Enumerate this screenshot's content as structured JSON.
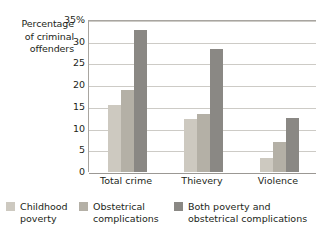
{
  "chart_data": {
    "type": "bar",
    "title": "",
    "xlabel": "",
    "ylabel": "Percentage of criminal offenders",
    "ylim": [
      0,
      35
    ],
    "ytick_labels": [
      "35%",
      "30",
      "25",
      "20",
      "15",
      "10",
      "5",
      "0"
    ],
    "ytick_values": [
      35,
      30,
      25,
      20,
      15,
      10,
      5,
      0
    ],
    "grid": true,
    "legend_position": "bottom",
    "categories": [
      "Total crime",
      "Thievery",
      "Violence"
    ],
    "series": [
      {
        "name": "Childhood poverty",
        "color": "#cdc9c0",
        "values": [
          15.5,
          12.3,
          3.2
        ]
      },
      {
        "name": "Obstetrical complications",
        "color": "#b4b0a6",
        "values": [
          18.8,
          13.3,
          7.0
        ]
      },
      {
        "name": "Both poverty and obstetrical complications",
        "color": "#8a8884",
        "values": [
          32.7,
          28.3,
          12.4
        ]
      }
    ]
  },
  "axis": {
    "y_title": "Percentage\nof criminal\noffenders",
    "y_title_line_1": "Percentage",
    "y_title_line_2": "of criminal",
    "y_title_line_3": "offenders"
  },
  "legend": {
    "items": [
      {
        "label": "Childhood\npoverty",
        "color": "#cdc9c0"
      },
      {
        "label": "Obstetrical\ncomplications",
        "color": "#b4b0a6"
      },
      {
        "label": "Both poverty and\nobstetrical complications",
        "color": "#8a8884"
      }
    ]
  },
  "colors": {
    "series_light": "#cdc9c0",
    "series_medium": "#b4b0a6",
    "series_dark": "#8a8884",
    "gridline": "#cdcbc6",
    "axis_line": "#a8a5a0",
    "text": "#231f20",
    "background": "#ffffff"
  }
}
